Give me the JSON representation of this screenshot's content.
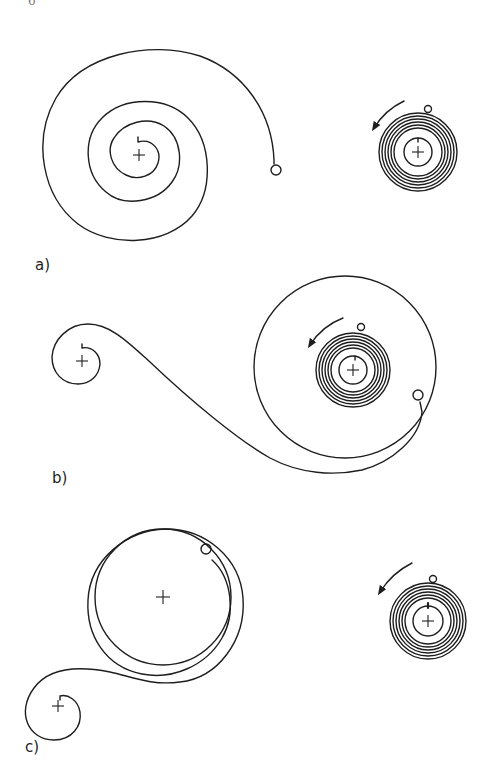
{
  "page": {
    "page_number_fragment": "6",
    "background": "#ffffff",
    "ink_color": "#1e1e1e"
  },
  "figure": {
    "panels": [
      {
        "id": "a",
        "label": "a)",
        "elements": [
          "free-spiral-spring-with-end-eyelet",
          "wound-coil-with-arrow"
        ],
        "arrow_direction": "counterclockwise"
      },
      {
        "id": "b",
        "label": "b)",
        "elements": [
          "small-curled-end-with-center",
          "s-curve-spring",
          "barrel-circle-with-eyelet",
          "wound-coil-with-arrow"
        ],
        "arrow_direction": "counterclockwise"
      },
      {
        "id": "c",
        "label": "c)",
        "elements": [
          "double-ring-spring-with-eyelet",
          "small-curled-end-with-center",
          "wound-coil-with-arrow"
        ],
        "arrow_direction": "counterclockwise"
      }
    ]
  }
}
